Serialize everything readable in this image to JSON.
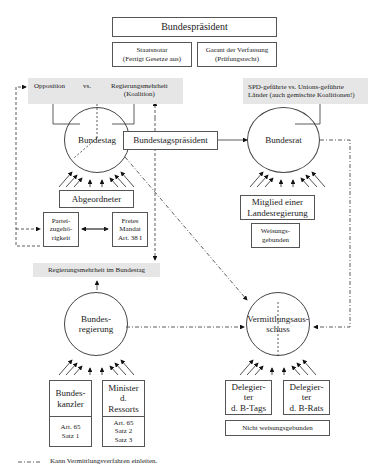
{
  "top": {
    "bundespraesident": "Bundespräsident",
    "staatsnotar": "Staatsnotar\n(Fertigt Gesetze aus)",
    "garant": "Garant der Verfassung\n(Prüfungsrecht)"
  },
  "bundestag_side": {
    "opposition": "Opposition",
    "vs": "vs.",
    "regierungsmehrheit": "Regierungsmehrheit\n(Koalition)",
    "circle": "Bundestag",
    "praesident": "Bundestagspräsident",
    "abgeordneter": "Abgeordneter",
    "partei": "Partei-\nzugehö-\nrigkeit",
    "mandat": "Freies\nMandat\nArt. 38 I"
  },
  "bundesrat_side": {
    "laender": "SPD-geführte vs. Unions-geführte\nLänder (auch gemischte Koalitionen!)",
    "circle": "Bundesrat",
    "mitglied": "Mitglied einer\nLandesregierung",
    "weisung": "Weisungs-\ngebunden"
  },
  "regierung_side": {
    "mehrheit": "Regierungsmehrheit im Bundestag",
    "circle": "Bundes-\nregierung",
    "kanzler": "Bundes-\nkanzler",
    "kanzler_art": "Art. 65\nSatz 1",
    "minister": "Minister\nd.\nRessorts",
    "minister_art": "Art. 65\nSatz 2\nSatz 3"
  },
  "vermittlung_side": {
    "circle": "Vermittlungsaus-\nschuss",
    "deleg_tag": "Delegier-\nter\nd. B-Tags",
    "deleg_rat": "Delegier-\nter\nd. B-Rats",
    "nicht_weisung": "Nicht weisungsgebunden"
  },
  "legend": {
    "text": "Kann Vermittlungsverfahren einleiten."
  }
}
